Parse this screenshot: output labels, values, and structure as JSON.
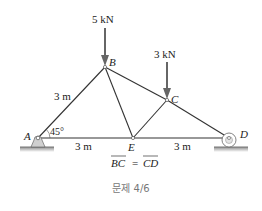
{
  "diagram": {
    "type": "truss",
    "nodes": {
      "A": {
        "label": "A",
        "x": 38,
        "y": 138,
        "support": "pin"
      },
      "B": {
        "label": "B",
        "x": 105,
        "y": 67
      },
      "C": {
        "label": "C",
        "x": 167,
        "y": 100
      },
      "D": {
        "label": "D",
        "x": 229,
        "y": 138,
        "support": "roller"
      },
      "E": {
        "label": "E",
        "x": 133,
        "y": 138
      }
    },
    "members": [
      [
        "A",
        "B"
      ],
      [
        "B",
        "C"
      ],
      [
        "C",
        "D"
      ],
      [
        "A",
        "E"
      ],
      [
        "E",
        "D"
      ],
      [
        "B",
        "E"
      ],
      [
        "C",
        "E"
      ]
    ],
    "loads": [
      {
        "node": "B",
        "label": "5 kN",
        "direction": "down"
      },
      {
        "node": "C",
        "label": "3 kN",
        "direction": "down"
      }
    ],
    "dimensions": {
      "AB": "3 m",
      "AE": "3 m",
      "ED": "3 m",
      "angle_A": "45°"
    },
    "condition": {
      "left": "BC",
      "equals": "=",
      "right": "CD"
    },
    "caption": "문제 4/6"
  },
  "colors": {
    "line": "#333333",
    "arrow": "#666666",
    "support_fill": "#cfcfcf",
    "ground": "#9a9a9a",
    "caption": "#777777"
  }
}
